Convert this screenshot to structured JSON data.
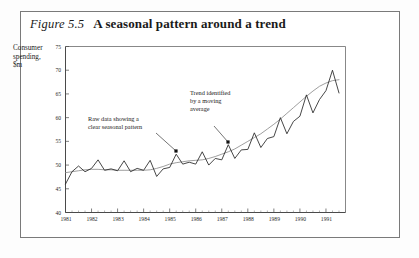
{
  "figure": {
    "number_label": "Figure 5.5",
    "title": "A seasonal pattern around a trend"
  },
  "chart_data": {
    "type": "line",
    "title": "A seasonal pattern around a trend",
    "xlabel": "",
    "ylabel": "Consumer spending, $m",
    "ylabel_lines": [
      "Consumer",
      "spending,",
      "$m"
    ],
    "xlim": [
      1981.0,
      1991.75
    ],
    "ylim": [
      40,
      75
    ],
    "yticks": [
      40,
      45,
      50,
      55,
      60,
      65,
      70,
      75
    ],
    "xticks": [
      1981,
      1982,
      1983,
      1984,
      1985,
      1986,
      1987,
      1988,
      1989,
      1990,
      1991
    ],
    "xtick_labels": [
      "1981",
      "1982",
      "1983",
      "1984",
      "1985",
      "1986",
      "1987",
      "1988",
      "1989",
      "1990",
      "1991"
    ],
    "grid": false,
    "legend": "none",
    "minor_ticks_per_year": 4,
    "x": [
      1981.0,
      1981.25,
      1981.5,
      1981.75,
      1982.0,
      1982.25,
      1982.5,
      1982.75,
      1983.0,
      1983.25,
      1983.5,
      1983.75,
      1984.0,
      1984.25,
      1984.5,
      1984.75,
      1985.0,
      1985.25,
      1985.5,
      1985.75,
      1986.0,
      1986.25,
      1986.5,
      1986.75,
      1987.0,
      1987.25,
      1987.5,
      1987.75,
      1988.0,
      1988.25,
      1988.5,
      1988.75,
      1989.0,
      1989.25,
      1989.5,
      1989.75,
      1990.0,
      1990.25,
      1990.5,
      1990.75,
      1991.0,
      1991.25,
      1991.5
    ],
    "series": [
      {
        "name": "Raw data",
        "style": "solid-dark",
        "values": [
          46.0,
          48.6,
          49.8,
          48.6,
          49.3,
          51.1,
          48.9,
          49.2,
          48.8,
          50.9,
          48.6,
          49.3,
          48.9,
          51.0,
          47.6,
          49.2,
          49.5,
          52.3,
          50.2,
          50.6,
          50.2,
          52.8,
          50.0,
          51.4,
          51.1,
          54.3,
          51.4,
          53.2,
          53.3,
          56.8,
          53.7,
          55.6,
          56.0,
          60.0,
          56.6,
          59.2,
          60.3,
          64.8,
          61.0,
          63.8,
          65.7,
          70.0,
          65.2
        ]
      },
      {
        "name": "Trend identified by a moving average",
        "style": "solid-grey",
        "values": [
          48.4,
          48.6,
          48.8,
          49.0,
          49.1,
          49.1,
          49.0,
          49.0,
          48.9,
          48.9,
          48.9,
          48.9,
          48.9,
          49.0,
          49.3,
          49.7,
          50.2,
          50.5,
          50.7,
          50.9,
          51.0,
          51.1,
          51.4,
          51.8,
          52.3,
          52.8,
          53.4,
          54.2,
          55.0,
          55.8,
          56.6,
          57.6,
          58.6,
          59.7,
          60.9,
          62.1,
          63.3,
          64.5,
          65.6,
          66.6,
          67.3,
          67.8,
          68.0
        ]
      }
    ],
    "annotations": [
      {
        "id": "raw-data-annotation",
        "lines": [
          "Raw data showing a",
          "clear seasonal pattern"
        ],
        "text_x": 88,
        "text_y": 121,
        "leader_from_x": 156,
        "leader_from_y": 133,
        "leader_to_x": 176,
        "leader_to_y": 151,
        "marker_x": 176,
        "marker_y": 151
      },
      {
        "id": "trend-annotation",
        "lines": [
          "Trend identified",
          "by a moving",
          "average"
        ],
        "text_x": 190,
        "text_y": 95,
        "leader_from_x": 214,
        "leader_from_y": 126,
        "leader_to_x": 228,
        "leader_to_y": 142,
        "marker_x": 228,
        "marker_y": 142
      }
    ],
    "colors": {
      "raw_series": "#262626",
      "trend_series": "#8c8c8c",
      "axis": "#4a4a4a",
      "frame": "#6a6a6a",
      "background": "#ffffff"
    }
  }
}
